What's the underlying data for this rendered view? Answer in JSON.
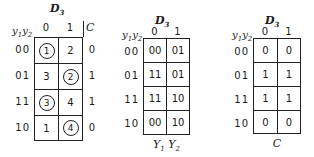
{
  "maps": [
    {
      "title": {
        "main": "D",
        "sub": "3"
      },
      "corner": {
        "a": "y",
        "a_sub": "1",
        "b": "y",
        "b_sub": "2"
      },
      "col_headers": [
        "0",
        "1"
      ],
      "row_headers": [
        "00",
        "01",
        "11",
        "10"
      ],
      "cells": [
        [
          {
            "v": "1",
            "circled": true
          },
          {
            "v": "2",
            "circled": false
          }
        ],
        [
          {
            "v": "3",
            "circled": false
          },
          {
            "v": "2",
            "circled": true
          }
        ],
        [
          {
            "v": "3",
            "circled": true
          },
          {
            "v": "4",
            "circled": false
          }
        ],
        [
          {
            "v": "1",
            "circled": false
          },
          {
            "v": "4",
            "circled": true
          }
        ]
      ],
      "side_header": "C",
      "side_values": [
        "0",
        "1",
        "1",
        "0"
      ]
    },
    {
      "title": {
        "main": "D",
        "sub": "3"
      },
      "corner": {
        "a": "y",
        "a_sub": "1",
        "b": "y",
        "b_sub": "2"
      },
      "col_headers": [
        "0",
        "1"
      ],
      "row_headers": [
        "00",
        "01",
        "11",
        "10"
      ],
      "cells": [
        [
          "00",
          "01"
        ],
        [
          "11",
          "01"
        ],
        [
          "11",
          "10"
        ],
        [
          "00",
          "10"
        ]
      ],
      "footer": {
        "a": "Y",
        "a_sub": "1",
        "b": "Y",
        "b_sub": "2"
      }
    },
    {
      "title": {
        "main": "D",
        "sub": "3"
      },
      "corner": {
        "a": "y",
        "a_sub": "1",
        "b": "y",
        "b_sub": "2"
      },
      "col_headers": [
        "0",
        "1"
      ],
      "row_headers": [
        "00",
        "01",
        "11",
        "10"
      ],
      "cells": [
        [
          "0",
          "0"
        ],
        [
          "1",
          "1"
        ],
        [
          "1",
          "1"
        ],
        [
          "0",
          "0"
        ]
      ],
      "footer": {
        "a": "C"
      }
    }
  ]
}
